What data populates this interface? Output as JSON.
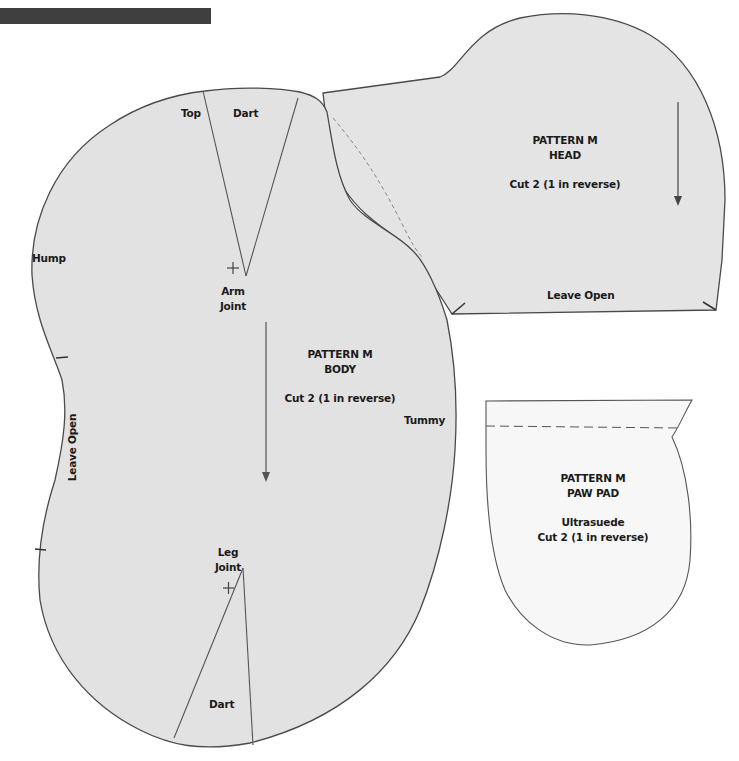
{
  "page": {
    "header_bar_color": "#3f3f3f",
    "background": "#ffffff",
    "fabric_fill": "#e6e6e6",
    "paw_fill": "#f8f8f8",
    "outline_color": "#555555"
  },
  "pieces": {
    "body": {
      "title": "PATTERN M",
      "name": "BODY",
      "instruction": "Cut 2 (1 in reverse)",
      "labels": {
        "top": "Top",
        "top_dart": "Dart",
        "hump": "Hump",
        "arm_joint_1": "Arm",
        "arm_joint_2": "Joint",
        "leave_open": "Leave Open",
        "tummy": "Tummy",
        "leg_joint_1": "Leg",
        "leg_joint_2": "Joint",
        "bottom_dart": "Dart"
      }
    },
    "head": {
      "title": "PATTERN M",
      "name": "HEAD",
      "instruction": "Cut 2 (1 in reverse)",
      "labels": {
        "leave_open": "Leave Open"
      }
    },
    "paw_pad": {
      "title": "PATTERN M",
      "name": "PAW PAD",
      "material": "Ultrasuede",
      "instruction": "Cut 2 (1 in reverse)"
    }
  }
}
